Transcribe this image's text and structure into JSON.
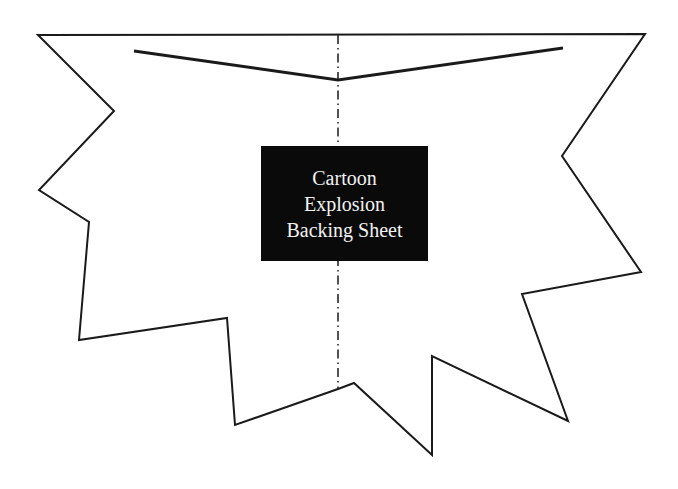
{
  "title": {
    "lines": [
      "Cartoon",
      "Explosion",
      "Backing Sheet"
    ]
  },
  "shape": {
    "type": "explosion-outline",
    "stroke_color": "#1a1a1a",
    "fill_color": "#ffffff",
    "points": "38,35 645,34 562,156 641,272 522,294 568,421 432,356 432,455 354,383 338,389 235,425 227,318 79,340 89,222 39,190 114,111"
  },
  "fold_line": {
    "style": "dash-dot",
    "x": 338,
    "y1": 35,
    "y2": 389
  },
  "top_crease": {
    "points": "134,51 338,80 563,48"
  },
  "colors": {
    "label_background": "#0a0a0a",
    "label_text": "#f2f2f2",
    "line": "#1a1a1a"
  }
}
